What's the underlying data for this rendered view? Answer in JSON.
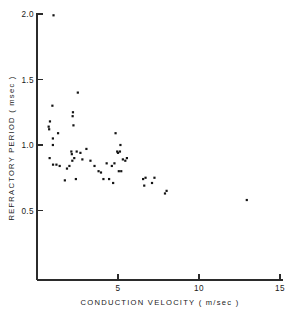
{
  "chart_data": {
    "type": "scatter",
    "title": "",
    "xlabel": "CONDUCTION  VELOCITY   ( m/sec )",
    "ylabel": "REFRACTORY  PERIOD  ( msec )",
    "xlim": [
      0,
      15
    ],
    "ylim": [
      0,
      2.0
    ],
    "xticks": [
      5,
      10,
      15
    ],
    "xtick_labels": [
      "5",
      "10",
      "15"
    ],
    "yticks": [
      0.5,
      1.0,
      1.5,
      2.0
    ],
    "ytick_labels": [
      "0.5",
      "1.0",
      "1.5",
      "2.0"
    ],
    "grid": false,
    "legend": null,
    "marker": "square",
    "marker_color": "#141414",
    "marker_size": 2.2,
    "series": [
      {
        "name": "nerve fibers",
        "points": [
          [
            1.02,
            1.99
          ],
          [
            0.72,
            1.14
          ],
          [
            0.75,
            1.12
          ],
          [
            0.8,
            1.18
          ],
          [
            0.78,
            0.9
          ],
          [
            0.95,
            1.3
          ],
          [
            0.98,
            1.05
          ],
          [
            0.98,
            1.0
          ],
          [
            0.99,
            0.85
          ],
          [
            1.2,
            0.85
          ],
          [
            1.3,
            1.09
          ],
          [
            1.4,
            0.84
          ],
          [
            1.72,
            0.73
          ],
          [
            1.85,
            0.82
          ],
          [
            2.0,
            0.84
          ],
          [
            2.12,
            0.95
          ],
          [
            2.15,
            0.93
          ],
          [
            2.18,
            0.88
          ],
          [
            2.2,
            1.22
          ],
          [
            2.22,
            1.25
          ],
          [
            2.25,
            1.15
          ],
          [
            2.3,
            0.9
          ],
          [
            2.4,
            0.74
          ],
          [
            2.45,
            0.95
          ],
          [
            2.52,
            1.4
          ],
          [
            2.68,
            0.94
          ],
          [
            2.8,
            0.89
          ],
          [
            3.05,
            0.97
          ],
          [
            3.3,
            0.88
          ],
          [
            3.55,
            0.84
          ],
          [
            3.8,
            0.8
          ],
          [
            3.95,
            0.79
          ],
          [
            4.1,
            0.74
          ],
          [
            4.3,
            0.86
          ],
          [
            4.45,
            0.74
          ],
          [
            4.62,
            0.84
          ],
          [
            4.7,
            0.71
          ],
          [
            4.78,
            0.86
          ],
          [
            4.85,
            1.09
          ],
          [
            4.95,
            0.95
          ],
          [
            5.0,
            0.94
          ],
          [
            5.05,
            0.8
          ],
          [
            5.12,
            0.95
          ],
          [
            5.15,
            1.0
          ],
          [
            5.2,
            0.8
          ],
          [
            5.3,
            0.89
          ],
          [
            5.45,
            0.88
          ],
          [
            5.55,
            0.9
          ],
          [
            6.55,
            0.74
          ],
          [
            6.62,
            0.69
          ],
          [
            6.7,
            0.75
          ],
          [
            7.1,
            0.71
          ],
          [
            7.25,
            0.75
          ],
          [
            7.9,
            0.63
          ],
          [
            8.0,
            0.65
          ],
          [
            12.95,
            0.58
          ]
        ]
      }
    ]
  },
  "axes": {
    "x_axis_name": "conduction-velocity-axis",
    "y_axis_name": "refractory-period-axis"
  }
}
